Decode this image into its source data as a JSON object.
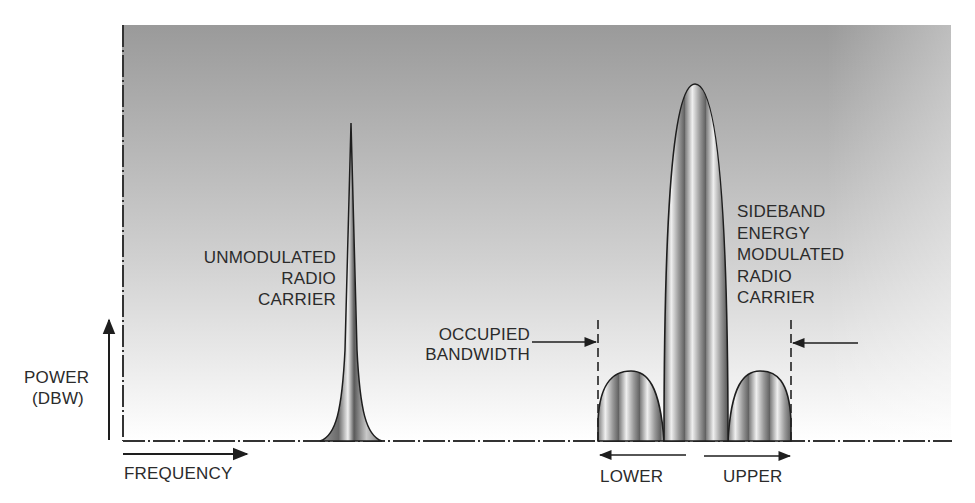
{
  "diagram": {
    "axes": {
      "y_label_line1": "POWER",
      "y_label_line2": "(DBW)",
      "x_label": "FREQUENCY"
    },
    "labels": {
      "unmodulated_line1": "UNMODULATED",
      "unmodulated_line2": "RADIO",
      "unmodulated_line3": "CARRIER",
      "occupied_line1": "OCCUPIED",
      "occupied_line2": "BANDWIDTH",
      "modulated_line1": "SIDEBAND",
      "modulated_line2": "ENERGY",
      "modulated_line3": "MODULATED",
      "modulated_line4": "RADIO",
      "modulated_line5": "CARRIER",
      "lower": "LOWER",
      "upper": "UPPER"
    },
    "colors": {
      "panel_top": "#9a9a9a",
      "panel_bottom": "#ffffff",
      "stroke": "#1e1e1e",
      "fill_dark": "#6e6e6e",
      "fill_light": "#e6e6e6"
    },
    "shapes": [
      {
        "name": "unmodulated-carrier-spike",
        "center_x": 351,
        "peak_y": 123,
        "base_y": 441
      },
      {
        "name": "lower-sideband-lobe",
        "x_start": 598,
        "x_end": 664,
        "peak_y": 371
      },
      {
        "name": "main-carrier-lobe",
        "x_start": 664,
        "x_end": 728,
        "peak_y": 84
      },
      {
        "name": "upper-sideband-lobe",
        "x_start": 728,
        "x_end": 791,
        "peak_y": 371
      }
    ]
  }
}
